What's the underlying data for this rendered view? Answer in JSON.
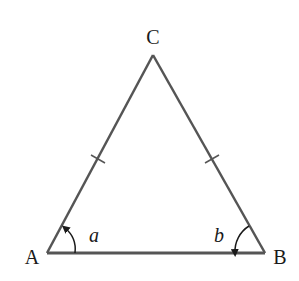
{
  "diagram": {
    "type": "isosceles-triangle",
    "vertices": {
      "A": {
        "label": "A"
      },
      "B": {
        "label": "B"
      },
      "C": {
        "label": "C"
      }
    },
    "angles": {
      "at_A": {
        "label": "a"
      },
      "at_B": {
        "label": "b"
      }
    },
    "equal_sides": [
      "AC",
      "BC"
    ],
    "colors": {
      "stroke": "#555555",
      "text": "#1a1a1a"
    }
  }
}
